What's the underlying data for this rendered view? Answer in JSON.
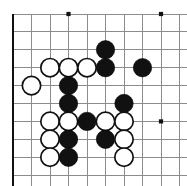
{
  "figure": {
    "title": "Go board position diagram",
    "type": "go-board-diagram",
    "board": {
      "width_px": 187,
      "height_px": 186,
      "columns": 10,
      "rows": 10,
      "origin_x": 13,
      "origin_y": 14,
      "spacing_x": 18.5,
      "spacing_y": 17.9,
      "edges": {
        "left": true,
        "top": false,
        "right": false,
        "bottom": true
      },
      "line_color": "#8c8c8c",
      "edge_color": "#111111",
      "background_color": "#ffffff"
    },
    "star_points": [
      {
        "col": 3,
        "row": 0
      },
      {
        "col": 8,
        "row": 0
      },
      {
        "col": 8,
        "row": 6
      }
    ],
    "stone_radius": 9.2,
    "stones": [
      {
        "color": "black",
        "col": 5,
        "row": 2
      },
      {
        "color": "black",
        "col": 5,
        "row": 3
      },
      {
        "color": "black",
        "col": 7,
        "row": 3
      },
      {
        "color": "white",
        "col": 2,
        "row": 3
      },
      {
        "color": "white",
        "col": 3,
        "row": 3
      },
      {
        "color": "white",
        "col": 4,
        "row": 3
      },
      {
        "color": "white",
        "col": 1,
        "row": 4
      },
      {
        "color": "black",
        "col": 3,
        "row": 4
      },
      {
        "color": "black",
        "col": 3,
        "row": 5
      },
      {
        "color": "black",
        "col": 6,
        "row": 5
      },
      {
        "color": "white",
        "col": 2,
        "row": 6
      },
      {
        "color": "white",
        "col": 3,
        "row": 6
      },
      {
        "color": "black",
        "col": 4,
        "row": 6
      },
      {
        "color": "white",
        "col": 5,
        "row": 6
      },
      {
        "color": "white",
        "col": 6,
        "row": 6
      },
      {
        "color": "white",
        "col": 2,
        "row": 7
      },
      {
        "color": "black",
        "col": 3,
        "row": 7
      },
      {
        "color": "black",
        "col": 5,
        "row": 7
      },
      {
        "color": "white",
        "col": 6,
        "row": 7
      },
      {
        "color": "white",
        "col": 2,
        "row": 8
      },
      {
        "color": "black",
        "col": 3,
        "row": 8
      },
      {
        "color": "white",
        "col": 6,
        "row": 8
      }
    ],
    "colors": {
      "black_stone": "#111111",
      "white_stone_fill": "#ffffff",
      "white_stone_border": "#111111",
      "grid": "#8c8c8c",
      "border": "#111111"
    }
  }
}
